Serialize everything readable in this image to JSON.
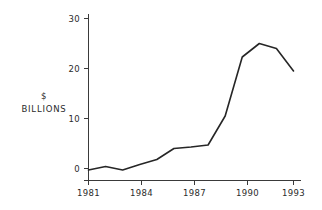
{
  "chart_data": {
    "type": "line",
    "title": "",
    "subtitle": "",
    "xlabel": "",
    "ylabel": "$ BILLIONS",
    "ylabel_lines": [
      "$",
      "BILLIONS"
    ],
    "x": [
      1981,
      1982,
      1983,
      1984,
      1985,
      1986,
      1987,
      1988,
      1989,
      1990,
      1991,
      1992,
      1993
    ],
    "values": [
      -0.3,
      0.4,
      -0.3,
      0.8,
      1.8,
      4.0,
      4.3,
      4.7,
      10.5,
      22.3,
      25.0,
      24.0,
      19.5
    ],
    "series": [
      {
        "name": "",
        "values": [
          -0.3,
          0.4,
          -0.3,
          0.8,
          1.8,
          4.0,
          4.3,
          4.7,
          10.5,
          22.3,
          25.0,
          24.0,
          19.5
        ]
      }
    ],
    "xlim": [
      1981,
      1993
    ],
    "ylim": [
      -1,
      31
    ],
    "xticks": [
      1981,
      1984,
      1987,
      1990,
      1993
    ],
    "xticklabels": [
      "1981",
      "1984",
      "1987",
      "1990",
      "1993"
    ],
    "yticks": [
      0,
      10,
      20,
      30
    ],
    "yticklabels": [
      "0",
      "10",
      "20",
      "30"
    ],
    "grid": false,
    "legend": false,
    "legend_position": "none",
    "line_color": "#262626",
    "axis_color": "#3a3a3a",
    "background_color": "#ffffff"
  }
}
